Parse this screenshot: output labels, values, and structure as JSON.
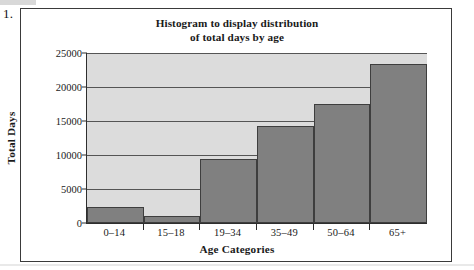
{
  "item_number": "1.",
  "chart_data": {
    "type": "bar",
    "title_line1": "Histogram to display distribution",
    "title_line2": "of total days by age",
    "xlabel": "Age Categories",
    "ylabel": "Total Days",
    "categories": [
      "0–14",
      "15–18",
      "19–34",
      "35–49",
      "50–64",
      "65+"
    ],
    "values": [
      2400,
      1000,
      9400,
      14300,
      17500,
      23400
    ],
    "ylim": [
      0,
      25000
    ],
    "ytick_labels": [
      "25000",
      "20000",
      "15000",
      "10000",
      "5000",
      "0"
    ],
    "ytick_values": [
      25000,
      20000,
      15000,
      10000,
      5000,
      0
    ],
    "grid": true,
    "legend": "none",
    "bar_color": "#808080",
    "plot_background": "#dcdcdc",
    "gridline_color": "#555555",
    "axis_color": "#2e2e2e"
  }
}
